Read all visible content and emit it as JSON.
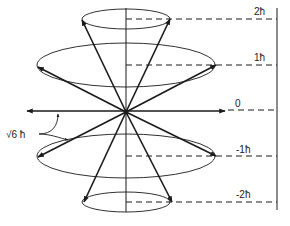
{
  "diagram": {
    "magnitude_label": "√6 ħ",
    "levels": [
      {
        "m": 2,
        "label": "2ħ",
        "y": 19,
        "rx": 44,
        "ry": 10,
        "left_tip_x": 82,
        "right_tip_x": 170
      },
      {
        "m": 1,
        "label": "1ħ",
        "y": 65,
        "rx": 89,
        "ry": 22,
        "left_tip_x": 38,
        "right_tip_x": 216
      },
      {
        "m": 0,
        "label": "0",
        "y": 111,
        "rx": 0,
        "ry": 0,
        "left_tip_x": 27,
        "right_tip_x": 225
      },
      {
        "m": -1,
        "label": "-1ħ",
        "y": 156,
        "rx": 89,
        "ry": 22,
        "left_tip_x": 38,
        "right_tip_x": 216
      },
      {
        "m": -2,
        "label": "-2ħ",
        "y": 202,
        "rx": 44,
        "ry": 10,
        "left_tip_x": 84,
        "right_tip_x": 172
      }
    ],
    "origin": {
      "x": 126,
      "y": 112
    },
    "colors": {
      "line": "#1a1a1a",
      "background": "#ffffff"
    }
  }
}
